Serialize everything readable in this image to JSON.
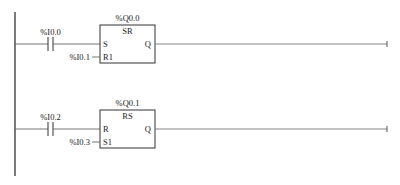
{
  "diagram": {
    "type": "ladder-logic",
    "rungs": [
      {
        "contact_label": "%I0.0",
        "block": {
          "output_tag": "%Q0.0",
          "type": "SR",
          "input_1": "S",
          "input_2": "R1",
          "output": "Q",
          "input_2_tag": "%I0.1"
        }
      },
      {
        "contact_label": "%I0.2",
        "block": {
          "output_tag": "%Q0.1",
          "type": "RS",
          "input_1": "R",
          "input_2": "S1",
          "output": "Q",
          "input_2_tag": "%I0.3"
        }
      }
    ]
  },
  "colors": {
    "line": "#444444",
    "rail": "#333333",
    "text": "#222222"
  }
}
